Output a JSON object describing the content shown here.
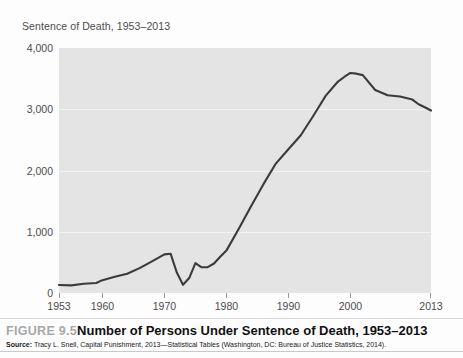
{
  "chart_title": "Sentence of Death, 1953–2013",
  "caption": {
    "figure_number": "FIGURE 9.5",
    "figure_text": "Number of Persons Under Sentence of Death, 1953–2013",
    "source_label": "Source:",
    "source_text": " Tracy L. Snell, Capital Punishment, 2013—Statistical Tables (Washington, DC: Bureau of Justice Statistics, 2014)."
  },
  "colors": {
    "plot_background": "#e4e4e4",
    "line": "#3b3b3b",
    "gridline": "#f2f2f2",
    "axis_text": "#4c4c4c",
    "figure_number": "#a8a8a8"
  },
  "chart_data": {
    "type": "line",
    "title": "Sentence of Death, 1953–2013",
    "xlabel": "",
    "ylabel": "",
    "xlim": [
      1953,
      2013
    ],
    "ylim": [
      0,
      4000
    ],
    "grid": true,
    "legend": false,
    "ytick_labels": [
      "0",
      "1,000",
      "2,000",
      "3,000",
      "4,000"
    ],
    "ytick_values": [
      0,
      1000,
      2000,
      3000,
      4000
    ],
    "xtick_labels": [
      "1953",
      "1960",
      "1970",
      "1980",
      "1990",
      "2000",
      "2013"
    ],
    "xtick_values": [
      1953,
      1960,
      1970,
      1980,
      1990,
      2000,
      2013
    ],
    "series": [
      {
        "name": "Persons under sentence of death",
        "x": [
          1953,
          1955,
          1957,
          1959,
          1960,
          1962,
          1964,
          1966,
          1968,
          1970,
          1971,
          1972,
          1973,
          1974,
          1975,
          1976,
          1977,
          1978,
          1979,
          1980,
          1982,
          1984,
          1986,
          1988,
          1990,
          1992,
          1994,
          1995,
          1996,
          1998,
          1999,
          2000,
          2001,
          2002,
          2004,
          2006,
          2008,
          2010,
          2011,
          2012,
          2013
        ],
        "values": [
          131,
          125,
          151,
          164,
          210,
          267,
          315,
          406,
          517,
          631,
          642,
          334,
          134,
          244,
          488,
          420,
          423,
          482,
          593,
          692,
          1050,
          1420,
          1781,
          2117,
          2346,
          2575,
          2890,
          3054,
          3219,
          3452,
          3527,
          3593,
          3581,
          3557,
          3315,
          3228,
          3207,
          3158,
          3082,
          3033,
          2979
        ]
      }
    ]
  }
}
